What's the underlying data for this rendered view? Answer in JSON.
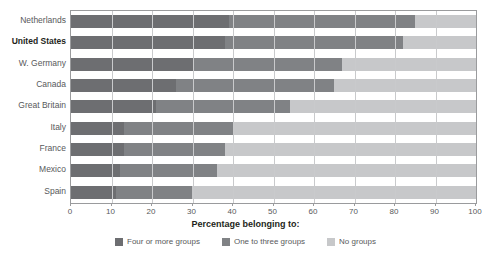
{
  "chart_data": {
    "type": "bar",
    "orientation": "horizontal",
    "stacked": true,
    "title": "Percentage belonging to:",
    "xlabel": "Percentage belonging to:",
    "ylabel": "",
    "xlim": [
      0,
      100
    ],
    "grid": true,
    "legend_position": "bottom",
    "categories": [
      "Netherlands",
      "United States",
      "W. Germany",
      "Canada",
      "Great Britain",
      "Italy",
      "France",
      "Mexico",
      "Spain"
    ],
    "emphasized_category": "United States",
    "xticks": [
      0,
      10,
      20,
      30,
      40,
      50,
      60,
      70,
      80,
      90,
      100
    ],
    "xtick_labels": [
      "0",
      "10",
      "20",
      "30",
      "40",
      "50",
      "60",
      "70",
      "80",
      "90",
      "100"
    ],
    "series": [
      {
        "name": "Four or more groups",
        "color": "#6d6e71",
        "values": [
          39,
          38,
          30,
          26,
          21,
          13,
          13,
          12,
          11
        ]
      },
      {
        "name": "One to three groups",
        "color": "#808285",
        "values": [
          46,
          44,
          37,
          39,
          33,
          27,
          25,
          24,
          19
        ]
      },
      {
        "name": "No groups",
        "color": "#c7c8ca",
        "values": [
          15,
          18,
          33,
          35,
          46,
          60,
          62,
          64,
          70
        ]
      }
    ],
    "cumulative_totals": {
      "four_or_more_plus_one_to_three": [
        85,
        82,
        67,
        65,
        54,
        40,
        38,
        36,
        30
      ]
    }
  },
  "legend": {
    "items": [
      {
        "label": "Four or more groups",
        "color": "#6d6e71"
      },
      {
        "label": "One to three groups",
        "color": "#808285"
      },
      {
        "label": "No groups",
        "color": "#c7c8ca"
      }
    ]
  }
}
